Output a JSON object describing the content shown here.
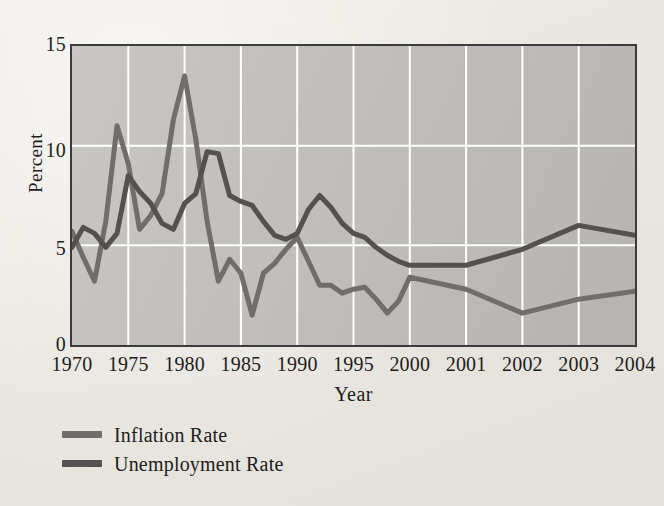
{
  "figure": {
    "background_color": "#ebe8e2",
    "plot_background_color": "#c3c1bd",
    "gridline_color": "#ffffff",
    "frame_color": "#3b3b3b"
  },
  "axes": {
    "y_title": "Percent",
    "x_title": "Year",
    "y_ticks": [
      "0",
      "5",
      "10",
      "15"
    ],
    "x_ticks": [
      "1970",
      "1975",
      "1980",
      "1985",
      "1990",
      "1995",
      "2000",
      "2001",
      "2002",
      "2003",
      "2004"
    ]
  },
  "legend": {
    "items": [
      {
        "label": "Inflation Rate",
        "color": "#706e6b"
      },
      {
        "label": "Unemployment Rate",
        "color": "#545250"
      }
    ]
  },
  "chart_data": {
    "type": "line",
    "title": "",
    "subtitle": "",
    "xlabel": "Year",
    "ylabel": "Percent",
    "ylim": [
      0,
      15
    ],
    "yticks": [
      0,
      5,
      10,
      15
    ],
    "grid": true,
    "legend_position": "below-axes-left",
    "x_axis_scale": "categorical-uneven",
    "x_tick_labels": [
      "1970",
      "1975",
      "1980",
      "1985",
      "1990",
      "1995",
      "2000",
      "2001",
      "2002",
      "2003",
      "2004"
    ],
    "x": [
      1970,
      1971,
      1972,
      1973,
      1974,
      1975,
      1976,
      1977,
      1978,
      1979,
      1980,
      1981,
      1982,
      1983,
      1984,
      1985,
      1986,
      1987,
      1988,
      1989,
      1990,
      1991,
      1992,
      1993,
      1994,
      1995,
      1996,
      1997,
      1998,
      1999,
      2000,
      2001,
      2002,
      2003,
      2004
    ],
    "series": [
      {
        "name": "Inflation Rate",
        "color": "#706e6b",
        "values": [
          5.7,
          4.4,
          3.2,
          6.2,
          11.0,
          9.1,
          5.8,
          6.5,
          7.6,
          11.3,
          13.5,
          10.3,
          6.2,
          3.2,
          4.3,
          3.6,
          1.5,
          3.6,
          4.1,
          4.8,
          5.4,
          4.2,
          3.0,
          3.0,
          2.6,
          2.8,
          2.9,
          2.3,
          1.6,
          2.2,
          3.4,
          2.8,
          1.6,
          2.3,
          2.7
        ],
        "annotations": [
          {
            "year": 1980,
            "value": 13.5,
            "note": "peak inflation"
          },
          {
            "year": 1986,
            "value": 1.5,
            "note": "trough"
          }
        ]
      },
      {
        "name": "Unemployment Rate",
        "color": "#545250",
        "values": [
          4.9,
          5.9,
          5.6,
          4.9,
          5.6,
          8.5,
          7.7,
          7.1,
          6.1,
          5.8,
          7.1,
          7.6,
          9.7,
          9.6,
          7.5,
          7.2,
          7.0,
          6.2,
          5.5,
          5.3,
          5.6,
          6.8,
          7.5,
          6.9,
          6.1,
          5.6,
          5.4,
          4.9,
          4.5,
          4.2,
          4.0,
          4.0,
          4.8,
          6.0,
          5.5
        ],
        "annotations": [
          {
            "year": 1982,
            "value": 9.7,
            "note": "peak unemployment"
          },
          {
            "year": 1992,
            "value": 7.5,
            "note": "secondary peak"
          }
        ]
      }
    ]
  }
}
